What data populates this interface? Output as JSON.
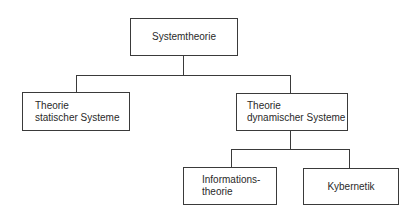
{
  "diagram": {
    "type": "hierarchy",
    "root": {
      "label": "Systemtheorie"
    },
    "level2": [
      {
        "line1": "Theorie",
        "line2": "statischer Systeme"
      },
      {
        "line1": "Theorie",
        "line2": "dynamischer Systeme"
      }
    ],
    "level3": [
      {
        "line1": "Informations-",
        "line2": "theorie"
      },
      {
        "line1": "Kybernetik"
      }
    ]
  }
}
